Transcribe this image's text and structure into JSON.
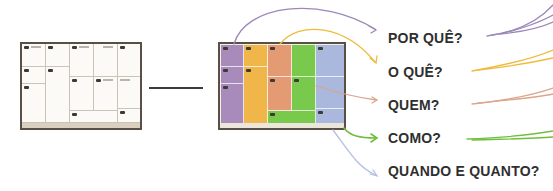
{
  "diagram": {
    "title": "",
    "left_canvas": {
      "description": "blank business model canvas",
      "fill": "#fbfaf7",
      "frame": "#5a4f45"
    },
    "right_canvas": {
      "description": "color-coded business model canvas",
      "columns": [
        {
          "name": "purple",
          "color": "#a98bbb"
        },
        {
          "name": "orange",
          "color": "#f0b64a"
        },
        {
          "name": "salmon",
          "color": "#e49a73"
        },
        {
          "name": "green",
          "color": "#79c94d"
        },
        {
          "name": "blue",
          "color": "#a9b8dc"
        }
      ]
    },
    "labels": [
      {
        "text": "POR QUÊ?",
        "color": "#9c88b8"
      },
      {
        "text": "O QUÊ?",
        "color": "#efbb3c"
      },
      {
        "text": "QUEM?",
        "color": "#dca48b"
      },
      {
        "text": "COMO?",
        "color": "#6fbf3e"
      },
      {
        "text": "QUANDO E QUANTO?",
        "color": "#b4c0e0"
      }
    ]
  }
}
